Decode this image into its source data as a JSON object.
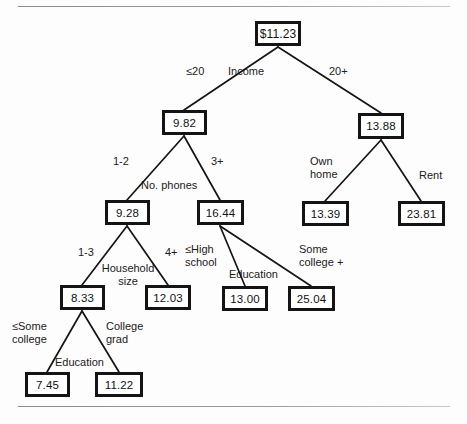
{
  "figure": {
    "background_color": "#fdfdfd",
    "rule_color": "#8d8d8d",
    "box_border_color": "#141414",
    "text_color": "#111111"
  },
  "nodes": {
    "root": {
      "value": "$11.23",
      "x": 255,
      "y": 21,
      "w": 46,
      "h": 25
    },
    "income_low": {
      "value": "9.82",
      "x": 162,
      "y": 110,
      "w": 45,
      "h": 25
    },
    "income_high": {
      "value": "13.88",
      "x": 358,
      "y": 113,
      "w": 46,
      "h": 26
    },
    "phones_low": {
      "value": "9.28",
      "x": 105,
      "y": 200,
      "w": 45,
      "h": 25
    },
    "phones_high": {
      "value": "16.44",
      "x": 197,
      "y": 200,
      "w": 47,
      "h": 25
    },
    "own_home": {
      "value": "13.39",
      "x": 302,
      "y": 201,
      "w": 47,
      "h": 25
    },
    "rent": {
      "value": "23.81",
      "x": 398,
      "y": 201,
      "w": 47,
      "h": 25
    },
    "hh_small": {
      "value": "8.33",
      "x": 60,
      "y": 285,
      "w": 45,
      "h": 25
    },
    "hh_large": {
      "value": "12.03",
      "x": 145,
      "y": 285,
      "w": 46,
      "h": 25
    },
    "edu_hs": {
      "value": "13.00",
      "x": 222,
      "y": 286,
      "w": 46,
      "h": 25
    },
    "edu_college": {
      "value": "25.04",
      "x": 288,
      "y": 286,
      "w": 47,
      "h": 25
    },
    "edu_some": {
      "value": "7.45",
      "x": 25,
      "y": 372,
      "w": 45,
      "h": 25
    },
    "edu_grad": {
      "value": "11.22",
      "x": 95,
      "y": 372,
      "w": 48,
      "h": 25
    }
  },
  "splits": [
    {
      "name": "income",
      "label": "Income",
      "left_label": "≤20",
      "right_label": "20+"
    },
    {
      "name": "no-phones",
      "label": "No. phones",
      "left_label": "1-2",
      "right_label": "3+"
    },
    {
      "name": "home-tenure",
      "label": "",
      "left_label": "Own\nhome",
      "right_label": "Rent"
    },
    {
      "name": "household-size",
      "label": "Household\nsize",
      "left_label": "1-3",
      "right_label": "4+"
    },
    {
      "name": "education-mid",
      "label": "Education",
      "left_label": "≤High\nschool",
      "right_label": "Some\ncollege  +"
    },
    {
      "name": "education-low",
      "label": "Education",
      "left_label": "≤Some\ncollege",
      "right_label": "College\ngrad"
    }
  ],
  "labels": {
    "income_split": "Income",
    "income_left": "≤20",
    "income_right": "20+",
    "phones_split": "No. phones",
    "phones_left": "1-2",
    "phones_right": "3+",
    "tenure_left": "Own\nhome",
    "tenure_right": "Rent",
    "household_split": "Household\nsize",
    "household_left": "1-3",
    "household_right": "4+",
    "education_mid_split": "Education",
    "education_mid_left": "≤High\nschool",
    "education_mid_right": "Some\ncollege  +",
    "education_low_split": "Education",
    "education_low_left": "≤Some\ncollege",
    "education_low_right": "College\ngrad"
  }
}
